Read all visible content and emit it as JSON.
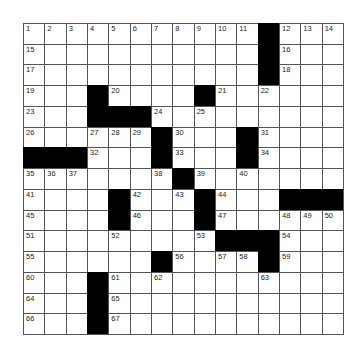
{
  "puzzle": {
    "rows": 15,
    "cols": 15,
    "colors": {
      "black": "#000000",
      "white": "#ffffff",
      "line": "#555555",
      "number": "#222222"
    },
    "grid": [
      [
        "1",
        "2",
        "3",
        "4",
        "5",
        "6",
        "7",
        "8",
        "9",
        "10",
        "11",
        "#",
        "12",
        "13",
        "14"
      ],
      [
        "15",
        "",
        "",
        "",
        "",
        "",
        "",
        "",
        "",
        "",
        "",
        "#",
        "16",
        "",
        ""
      ],
      [
        "17",
        "",
        "",
        "",
        "",
        "",
        "",
        "",
        "",
        "",
        "",
        "#",
        "18",
        "",
        ""
      ],
      [
        "19",
        "",
        "",
        "#",
        "20",
        "",
        "",
        "",
        "#",
        "21",
        "",
        "22",
        "",
        "",
        ""
      ],
      [
        "23",
        "",
        "",
        "#",
        "#",
        "#",
        "24",
        "",
        "25",
        "",
        "",
        "",
        "",
        "",
        ""
      ],
      [
        "26",
        "",
        "",
        "27",
        "28",
        "29",
        "#",
        "30",
        "",
        "",
        "#",
        "31",
        "",
        "",
        ""
      ],
      [
        "#",
        "#",
        "#",
        "32",
        "",
        "",
        "#",
        "33",
        "",
        "",
        "#",
        "34",
        "",
        "",
        ""
      ],
      [
        "35",
        "36",
        "37",
        "",
        "",
        "",
        "38",
        "#",
        "39",
        "",
        "40",
        "",
        "",
        "",
        ""
      ],
      [
        "41",
        "",
        "",
        "",
        "#",
        "42",
        "",
        "43",
        "#",
        "44",
        "",
        "",
        "#",
        "#",
        "#"
      ],
      [
        "45",
        "",
        "",
        "",
        "#",
        "46",
        "",
        "",
        "#",
        "47",
        "",
        "",
        "48",
        "49",
        "50"
      ],
      [
        "51",
        "",
        "",
        "",
        "52",
        "",
        "",
        "",
        "53",
        "#",
        "#",
        "#",
        "54",
        "",
        ""
      ],
      [
        "55",
        "",
        "",
        "",
        "",
        "",
        "#",
        "56",
        "",
        "57",
        "58",
        "#",
        "59",
        "",
        ""
      ],
      [
        "60",
        "",
        "",
        "#",
        "61",
        "",
        "62",
        "",
        "",
        "",
        "",
        "63",
        "",
        "",
        ""
      ],
      [
        "64",
        "",
        "",
        "#",
        "65",
        "",
        "",
        "",
        "",
        "",
        "",
        "",
        "",
        "",
        ""
      ],
      [
        "66",
        "",
        "",
        "#",
        "67",
        "",
        "",
        "",
        "",
        "",
        "",
        "",
        "",
        "",
        ""
      ]
    ]
  }
}
